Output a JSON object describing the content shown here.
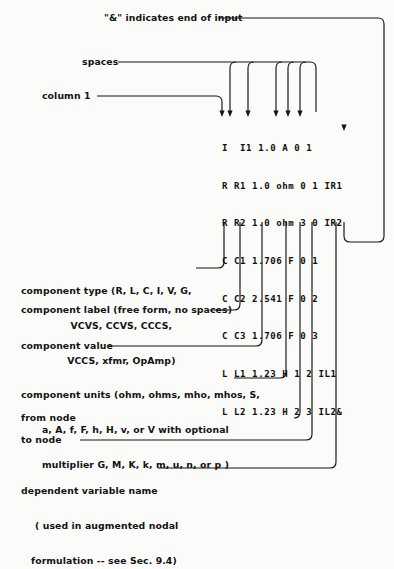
{
  "figure": {
    "ink_color": "#121212",
    "paper_color": "#fbfbf9"
  },
  "netlist": {
    "lines": [
      "I  I1 1.0 A 0 1",
      "R R1 1.0 ohm 0 1 IR1",
      "R R2 1.0 ohm 3 0 IR2",
      "C C1 1.706 F 0 1",
      "C C2 2.541 F 0 2",
      "C C3 1.706 F 0 3",
      "L L1 1.23 H 1 2 IL1",
      "L L2 1.23 H 2 3 IL2&"
    ]
  },
  "top_callouts": [
    {
      "name": "end-of-input",
      "text": "\"&\" indicates end of input"
    },
    {
      "name": "spaces",
      "text": "spaces"
    },
    {
      "name": "column-1",
      "text": "column 1"
    }
  ],
  "bottom_callouts": [
    {
      "name": "component-type",
      "lines": [
        "component type (R, L, C, I, V, G,",
        "VCVS, CCVS, CCCS,",
        "VCCS, xfmr, OpAmp)"
      ]
    },
    {
      "name": "component-label",
      "lines": [
        "component label (free form, no spaces)"
      ]
    },
    {
      "name": "component-value",
      "lines": [
        "component value"
      ]
    },
    {
      "name": "component-units",
      "lines": [
        "component units (ohm, ohms, mho, mhos, S,",
        "a, A, f, F, h, H, v, or V with optional",
        "multiplier G, M, K, k, m, u, n, or p )"
      ]
    },
    {
      "name": "from-node",
      "lines": [
        "from node"
      ]
    },
    {
      "name": "to-node",
      "lines": [
        "to node"
      ]
    },
    {
      "name": "dependent-variable-name",
      "lines": [
        "dependent variable name",
        "( used in augmented nodal",
        "formulation -- see Sec. 9.4)"
      ]
    }
  ]
}
